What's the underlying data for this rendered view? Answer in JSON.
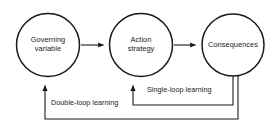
{
  "diagram": {
    "background_color": "#ffffff",
    "stroke_color": "#1a1a1a",
    "text_color": "#1a1a1a",
    "nodes": [
      {
        "id": "governing",
        "label": "Governing\nvariable",
        "shape": "circle",
        "cx": 48,
        "cy": 45,
        "r": 32
      },
      {
        "id": "action",
        "label": "Action\nstrategy",
        "shape": "circle",
        "cx": 141,
        "cy": 45,
        "r": 32
      },
      {
        "id": "consequences",
        "label": "Consequences",
        "shape": "circle",
        "cx": 233,
        "cy": 45,
        "r": 31
      }
    ],
    "edges": [
      {
        "id": "governing-to-action",
        "from": "governing",
        "to": "action",
        "label": "",
        "arrow": true
      },
      {
        "id": "action-to-consequences",
        "from": "action",
        "to": "consequences",
        "label": "",
        "arrow": true
      },
      {
        "id": "single-loop",
        "from": "consequences",
        "to": "action",
        "label": "Single-loop learning",
        "arrow": true
      },
      {
        "id": "double-loop",
        "from": "consequences",
        "to": "governing",
        "label": "Double-loop learning",
        "arrow": true
      }
    ]
  }
}
